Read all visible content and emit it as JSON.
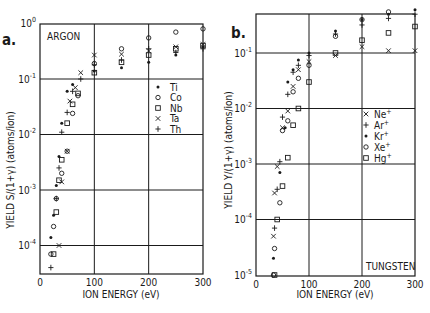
{
  "chart_data": [
    {
      "type": "scatter",
      "panel_label": "a.",
      "title": "ARGON",
      "xlabel": "ION ENERGY (eV)",
      "ylabel": "YIELD S/(1+γ) (atoms/ion)",
      "xscale": "linear",
      "yscale": "log",
      "xlim": [
        0,
        300
      ],
      "ylim": [
        3e-05,
        1
      ],
      "xticks": [
        0,
        100,
        200,
        300
      ],
      "xtick_labels": [
        "0",
        "100",
        "200",
        "300"
      ],
      "yticks": [
        1,
        0.1,
        0.01,
        0.001,
        0.0001
      ],
      "ytick_labels": [
        "10^0",
        "10^-1",
        "10^-2",
        "10^-3",
        "10^-4"
      ],
      "grid": true,
      "legend_position": "right-middle",
      "series": [
        {
          "name": "Ti",
          "marker": "dot",
          "x": [
            20,
            25,
            30,
            35,
            40,
            50,
            60,
            100,
            150,
            200,
            250,
            300
          ],
          "y": [
            0.00014,
            0.00035,
            0.0012,
            0.004,
            0.016,
            0.06,
            0.08,
            0.14,
            0.16,
            0.2,
            0.27,
            0.38
          ]
        },
        {
          "name": "Co",
          "marker": "circle",
          "x": [
            20,
            25,
            30,
            40,
            50,
            60,
            70,
            100,
            150,
            200,
            250,
            300
          ],
          "y": [
            7e-05,
            0.00022,
            0.0007,
            0.002,
            0.005,
            0.024,
            0.05,
            0.19,
            0.35,
            0.55,
            0.7,
            0.8
          ]
        },
        {
          "name": "Nb",
          "marker": "square",
          "x": [
            25,
            30,
            35,
            40,
            50,
            60,
            70,
            100,
            150,
            200,
            250,
            300
          ],
          "y": [
            7e-05,
            0.0004,
            0.0015,
            0.0035,
            0.016,
            0.035,
            0.055,
            0.13,
            0.2,
            0.27,
            0.35,
            0.4
          ]
        },
        {
          "name": "Ta",
          "marker": "x",
          "x": [
            35,
            40,
            50,
            55,
            65,
            75,
            100,
            150,
            200,
            250,
            300
          ],
          "y": [
            0.0001,
            0.0014,
            0.005,
            0.04,
            0.07,
            0.13,
            0.27,
            0.28,
            0.32,
            0.38,
            0.42
          ]
        },
        {
          "name": "Th",
          "marker": "plus",
          "x": [
            20,
            30,
            35,
            40,
            50,
            60,
            75,
            100,
            150,
            200,
            250,
            300
          ],
          "y": [
            4e-05,
            0.0007,
            0.0025,
            0.011,
            0.025,
            0.06,
            0.1,
            0.18,
            0.22,
            0.35,
            0.3,
            0.35
          ]
        }
      ],
      "legend": [
        "Ti",
        "Co",
        "Nb",
        "Ta",
        "Th"
      ]
    },
    {
      "type": "scatter",
      "panel_label": "b.",
      "title": "TUNGSTEN",
      "xlabel": "ION ENERGY (eV)",
      "ylabel": "YIELD Y/(1+γ) (atoms/ion)",
      "xscale": "linear",
      "yscale": "log",
      "xlim": [
        0,
        300
      ],
      "ylim": [
        1e-05,
        0.5
      ],
      "xticks": [
        0,
        100,
        200,
        300
      ],
      "xtick_labels": [
        "0",
        "100",
        "200",
        "300"
      ],
      "yticks": [
        0.1,
        0.01,
        0.001,
        0.0001,
        1e-05
      ],
      "ytick_labels": [
        "10^-1",
        "10^-2",
        "10^-3",
        "10^-4",
        "10^-5"
      ],
      "grid": true,
      "legend_position": "right-lower",
      "series": [
        {
          "name": "Ne+",
          "marker": "x",
          "x": [
            33,
            35,
            40,
            50,
            60,
            70,
            80,
            100,
            150,
            200,
            250,
            300
          ],
          "y": [
            5e-05,
            0.0003,
            0.0009,
            0.0045,
            0.009,
            0.025,
            0.05,
            0.07,
            0.09,
            0.13,
            0.11,
            0.11
          ]
        },
        {
          "name": "Ar+",
          "marker": "plus",
          "x": [
            35,
            40,
            45,
            50,
            60,
            70,
            80,
            100,
            150,
            200,
            250,
            300
          ],
          "y": [
            7e-05,
            0.00035,
            0.0011,
            0.007,
            0.018,
            0.045,
            0.06,
            0.09,
            0.22,
            0.32,
            0.42,
            0.5
          ]
        },
        {
          "name": "Kr+",
          "marker": "dot",
          "x": [
            33,
            45,
            55,
            60,
            70,
            80,
            100,
            150,
            200,
            250,
            300
          ],
          "y": [
            2e-05,
            0.0007,
            0.0045,
            0.03,
            0.05,
            0.075,
            0.1,
            0.25,
            0.4,
            0.5,
            0.6
          ]
        },
        {
          "name": "Xe+",
          "marker": "circle",
          "x": [
            33,
            35,
            45,
            50,
            60,
            70,
            80,
            100,
            150,
            200,
            250,
            300
          ],
          "y": [
            1e-05,
            3e-05,
            0.0002,
            0.004,
            0.006,
            0.02,
            0.035,
            0.06,
            0.2,
            0.4,
            0.55,
            0.7
          ]
        },
        {
          "name": "Hg+",
          "marker": "square",
          "x": [
            35,
            40,
            50,
            60,
            70,
            80,
            100,
            150,
            200,
            250,
            300
          ],
          "y": [
            1e-05,
            0.0001,
            0.0004,
            0.0013,
            0.005,
            0.01,
            0.03,
            0.1,
            0.17,
            0.23,
            0.3
          ]
        }
      ],
      "legend": [
        "Ne+",
        "Ar+",
        "Kr+",
        "Xe+",
        "Hg+"
      ]
    }
  ],
  "panels": {
    "a": {
      "label": "a.",
      "title": "ARGON",
      "xlabel": "ION ENERGY (eV)",
      "ylabel": "YIELD S/(1+γ)  (atoms/ion)",
      "xticks": [
        "0",
        "100",
        "200",
        "300"
      ],
      "yticks": [
        {
          "base": "10",
          "exp": "0"
        },
        {
          "base": "10",
          "exp": "-1"
        },
        {
          "base": "10",
          "exp": "-2"
        },
        {
          "base": "10",
          "exp": "-3"
        },
        {
          "base": "10",
          "exp": "-4"
        }
      ],
      "legend": [
        {
          "label": "Ti",
          "sup": "",
          "marker": "dot"
        },
        {
          "label": "Co",
          "sup": "",
          "marker": "circle"
        },
        {
          "label": "Nb",
          "sup": "",
          "marker": "square"
        },
        {
          "label": "Ta",
          "sup": "",
          "marker": "x"
        },
        {
          "label": "Th",
          "sup": "",
          "marker": "plus"
        }
      ]
    },
    "b": {
      "label": "b.",
      "title": "TUNGSTEN",
      "xlabel": "ION ENERGY (eV)",
      "ylabel": "YIELD Y/(1+γ)  (atoms/ion)",
      "xticks": [
        "0",
        "100",
        "200",
        "300"
      ],
      "yticks": [
        {
          "base": "10",
          "exp": "-1"
        },
        {
          "base": "10",
          "exp": "-2"
        },
        {
          "base": "10",
          "exp": "-3"
        },
        {
          "base": "10",
          "exp": "-4"
        },
        {
          "base": "10",
          "exp": "-5"
        }
      ],
      "legend": [
        {
          "label": "Ne",
          "sup": "+",
          "marker": "x"
        },
        {
          "label": "Ar",
          "sup": "+",
          "marker": "plus"
        },
        {
          "label": "Kr",
          "sup": "+",
          "marker": "dot"
        },
        {
          "label": "Xe",
          "sup": "+",
          "marker": "circle"
        },
        {
          "label": "Hg",
          "sup": "+",
          "marker": "square"
        }
      ]
    }
  },
  "colors": {
    "ink": "#1a1a1a",
    "background": "#ffffff"
  }
}
